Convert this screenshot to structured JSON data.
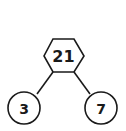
{
  "diagram": {
    "type": "number-bond",
    "whole": {
      "value": "21",
      "shape": "hexagon"
    },
    "parts": [
      {
        "value": "3",
        "shape": "circle"
      },
      {
        "value": "7",
        "shape": "circle"
      }
    ],
    "colors": {
      "stroke": "#1a1a1a",
      "fill": "#ffffff",
      "text": "#1a1a1a"
    }
  }
}
